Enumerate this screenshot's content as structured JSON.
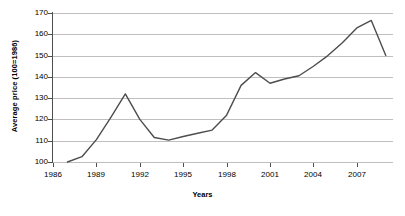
{
  "chart_data": {
    "type": "line",
    "title": "",
    "xlabel": "Years",
    "ylabel": "Average price (100=1986)",
    "xlim": [
      1986,
      2009.5
    ],
    "ylim": [
      100,
      170
    ],
    "grid": true,
    "legend": false,
    "y_ticks": [
      100,
      110,
      120,
      130,
      140,
      150,
      160,
      170
    ],
    "x_ticks": [
      1986,
      1989,
      1992,
      1995,
      1998,
      2001,
      2004,
      2007
    ],
    "x_tick_labels": [
      "1986",
      "1989",
      "1992",
      "1995",
      "1998",
      "2001",
      "2004",
      "2007"
    ],
    "y_tick_labels": [
      "100",
      "110",
      "120",
      "130",
      "140",
      "150",
      "160",
      "170"
    ],
    "series": [
      {
        "name": "Average price index",
        "color": "#4d4d4d",
        "x": [
          1987,
          1988,
          1989,
          1990,
          1991,
          1992,
          1993,
          1994,
          1995,
          1996,
          1997,
          1998,
          1999,
          2000,
          2001,
          2002,
          2003,
          2004,
          2005,
          2006,
          2007,
          2008,
          2009
        ],
        "values": [
          100,
          102.5,
          110.5,
          121,
          132,
          120,
          111.5,
          110.3,
          112,
          113.5,
          115,
          122,
          136,
          142,
          137,
          139,
          140.5,
          145,
          150,
          156,
          163,
          166.5,
          150
        ]
      }
    ]
  },
  "axes": {
    "y_axis_title": "Average price (100=1986)",
    "x_axis_title": "Years"
  }
}
